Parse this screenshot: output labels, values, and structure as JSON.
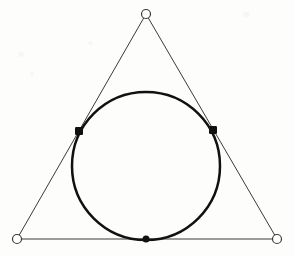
{
  "figure": {
    "background_color": "#fdfdfc",
    "width": 295,
    "height": 256
  },
  "chart_data": {
    "type": "diagram",
    "subtype": "geometric-construction",
    "coordinate_space": {
      "units": "pixels",
      "origin": "top-left",
      "width": 295,
      "height": 256
    },
    "triangle": {
      "label": "circumscribing-triangle",
      "stroke_color": "#3a3a3a",
      "stroke_width": 1,
      "fill": "none",
      "vertices": [
        {
          "name": "apex",
          "x": 146,
          "y": 14,
          "marker": "open-circle"
        },
        {
          "name": "bottom-left",
          "x": 17,
          "y": 239,
          "marker": "open-circle"
        },
        {
          "name": "bottom-right",
          "x": 277,
          "y": 239,
          "marker": "open-circle"
        }
      ],
      "edges": [
        {
          "name": "left-side",
          "from": "apex",
          "to": "bottom-left"
        },
        {
          "name": "right-side",
          "from": "apex",
          "to": "bottom-right"
        },
        {
          "name": "base",
          "from": "bottom-left",
          "to": "bottom-right"
        }
      ]
    },
    "circle": {
      "label": "inscribed-circle",
      "center_x": 146,
      "center_y": 166,
      "radius": 74,
      "stroke_color": "#111111",
      "stroke_width": 2.5,
      "fill": "none"
    },
    "tangency_points": [
      {
        "name": "left-tangency-point",
        "x": 79,
        "y": 131,
        "marker": "filled-square",
        "size": 8
      },
      {
        "name": "right-tangency-point",
        "x": 213,
        "y": 130,
        "marker": "filled-square",
        "size": 8
      },
      {
        "name": "bottom-tangency-point",
        "x": 146,
        "y": 239,
        "marker": "filled-circle",
        "size": 7
      }
    ],
    "vertex_marker_style": {
      "shape": "open-circle",
      "radius": 4.5,
      "fill": "#ffffff",
      "stroke": "#3a3a3a",
      "stroke_width": 1.2
    },
    "marker_fill_color": "#111111",
    "legend": null,
    "axes": null,
    "gridlines": false
  }
}
